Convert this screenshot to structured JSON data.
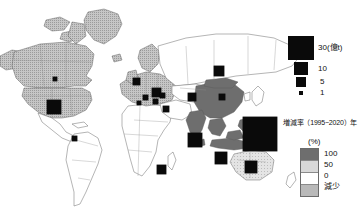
{
  "figure": {
    "type": "thematic-world-map",
    "background_color": "#fefefe"
  },
  "map": {
    "name": "world-map",
    "ocean_color": "#ffffff",
    "country_border_color": "#555555",
    "classes": {
      "decrease": "#b9b9b9",
      "zero_to_fifty": "#ffffff",
      "fifty_to_hundred": "#d8d8d8",
      "hundred_plus": "#6e6e6e"
    },
    "regions": [
      {
        "label": "Alaska",
        "class": "decrease"
      },
      {
        "label": "Canada",
        "class": "decrease"
      },
      {
        "label": "United States",
        "class": "decrease"
      },
      {
        "label": "Greenland",
        "class": "decrease"
      },
      {
        "label": "Europe",
        "class": "decrease"
      },
      {
        "label": "Russia",
        "class": "zero_to_fifty"
      },
      {
        "label": "China",
        "class": "hundred_plus"
      },
      {
        "label": "India",
        "class": "hundred_plus"
      },
      {
        "label": "Southeast Asia",
        "class": "hundred_plus"
      },
      {
        "label": "Australia",
        "class": "fifty_to_hundred"
      },
      {
        "label": "Africa",
        "class": "zero_to_fifty"
      },
      {
        "label": "South America",
        "class": "zero_to_fifty"
      }
    ]
  },
  "symbols": {
    "unit_note": "black squares sized in proportion to emissions in 億t",
    "items": [
      {
        "name": "symbol-canada",
        "x": 53,
        "y": 77,
        "size": 4,
        "value": 1
      },
      {
        "name": "symbol-united-states",
        "x": 47,
        "y": 100,
        "size": 14,
        "value": 5
      },
      {
        "name": "symbol-south-america",
        "x": 72,
        "y": 136,
        "size": 5,
        "value": 1
      },
      {
        "name": "symbol-uk",
        "x": 133,
        "y": 78,
        "size": 7,
        "value": 2
      },
      {
        "name": "symbol-germany",
        "x": 152,
        "y": 88,
        "size": 9,
        "value": 3
      },
      {
        "name": "symbol-france",
        "x": 143,
        "y": 95,
        "size": 5,
        "value": 1
      },
      {
        "name": "symbol-italy",
        "x": 153,
        "y": 99,
        "size": 5,
        "value": 1
      },
      {
        "name": "symbol-spain",
        "x": 137,
        "y": 101,
        "size": 4,
        "value": 1
      },
      {
        "name": "symbol-poland",
        "x": 160,
        "y": 93,
        "size": 5,
        "value": 1
      },
      {
        "name": "symbol-turkey",
        "x": 163,
        "y": 106,
        "size": 6,
        "value": 1
      },
      {
        "name": "symbol-russia",
        "x": 214,
        "y": 66,
        "size": 10,
        "value": 4
      },
      {
        "name": "symbol-kazakhstan",
        "x": 188,
        "y": 93,
        "size": 8,
        "value": 2
      },
      {
        "name": "symbol-china",
        "x": 219,
        "y": 94,
        "size": 6,
        "value": 1
      },
      {
        "name": "symbol-japan-pacific",
        "x": 243,
        "y": 117,
        "size": 34,
        "value": 30
      },
      {
        "name": "symbol-india",
        "x": 188,
        "y": 133,
        "size": 14,
        "value": 5
      },
      {
        "name": "symbol-indonesia",
        "x": 215,
        "y": 152,
        "size": 12,
        "value": 4
      },
      {
        "name": "symbol-australia",
        "x": 245,
        "y": 161,
        "size": 12,
        "value": 4
      },
      {
        "name": "symbol-south-africa",
        "x": 157,
        "y": 165,
        "size": 9,
        "value": 3
      }
    ]
  },
  "legend_symbols": {
    "name": "emission-size-legend",
    "items": [
      {
        "size": 26,
        "label": "30(億t)"
      },
      {
        "size": 14,
        "label": "10"
      },
      {
        "size": 10,
        "label": "5"
      },
      {
        "size": 5,
        "label": "1"
      }
    ]
  },
  "legend_rate": {
    "title": "増減率（1995−2020）年",
    "unit": "(%)",
    "bands": [
      {
        "color": "#6e6e6e",
        "label": "100"
      },
      {
        "color": "#d8d8d8",
        "label": "50"
      },
      {
        "color": "#ffffff",
        "label": "0"
      },
      {
        "color": "#b9b9b9",
        "label": "減少"
      }
    ]
  },
  "chart_data": {
    "type": "map",
    "symbol_scale_unit": "億t",
    "symbol_scale_breaks": [
      30,
      10,
      5,
      1
    ],
    "choropleth_variable": "増減率",
    "choropleth_unit": "%",
    "choropleth_breaks": [
      "100",
      "50",
      "0",
      "減少"
    ],
    "regions": [
      {
        "region": "United States",
        "emissions": 5,
        "rate_class": "減少"
      },
      {
        "region": "Canada",
        "emissions": 1,
        "rate_class": "減少"
      },
      {
        "region": "South America",
        "emissions": 1,
        "rate_class": "0-50"
      },
      {
        "region": "United Kingdom",
        "emissions": 2,
        "rate_class": "減少"
      },
      {
        "region": "Germany",
        "emissions": 3,
        "rate_class": "減少"
      },
      {
        "region": "France",
        "emissions": 1,
        "rate_class": "減少"
      },
      {
        "region": "Italy",
        "emissions": 1,
        "rate_class": "減少"
      },
      {
        "region": "Spain",
        "emissions": 1,
        "rate_class": "減少"
      },
      {
        "region": "Poland",
        "emissions": 1,
        "rate_class": "減少"
      },
      {
        "region": "Turkey",
        "emissions": 1,
        "rate_class": "0-50"
      },
      {
        "region": "Russia",
        "emissions": 4,
        "rate_class": "0-50"
      },
      {
        "region": "Kazakhstan",
        "emissions": 2,
        "rate_class": "0-50"
      },
      {
        "region": "China",
        "emissions": 30,
        "rate_class": "100+"
      },
      {
        "region": "India",
        "emissions": 5,
        "rate_class": "100+"
      },
      {
        "region": "Indonesia",
        "emissions": 4,
        "rate_class": "100+"
      },
      {
        "region": "Australia",
        "emissions": 4,
        "rate_class": "50-100"
      },
      {
        "region": "South Africa",
        "emissions": 3,
        "rate_class": "0-50"
      }
    ]
  }
}
